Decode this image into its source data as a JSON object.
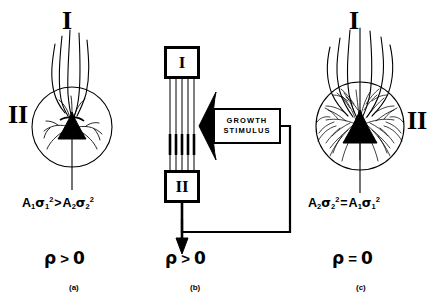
{
  "figure": {
    "caption_type": "three-panel neuronal growth diagram",
    "background_color": "#ffffff",
    "ink_color": "#000000"
  },
  "panels": [
    {
      "id": "a",
      "label": "(a)",
      "layer_top_label": "I",
      "layer_side_label": "II",
      "side_label_position": "left",
      "formula": {
        "lhs_amplitude": "A",
        "lhs_amplitude_sub": "1",
        "lhs_sigma_sub": "1",
        "lhs_sigma_sup": "2",
        "operator": ">",
        "rhs_amplitude": "A",
        "rhs_amplitude_sub": "2",
        "rhs_sigma_sub": "2",
        "rhs_sigma_sup": "2",
        "plain": "A1 σ1² > A2 σ2²"
      },
      "rho": {
        "symbol": "ρ",
        "relation": ">",
        "value": "0",
        "plain": "ρ > 0"
      },
      "neuron": {
        "arbor_density": "sparse",
        "soma_shape": "triangular",
        "field_shape": "circle"
      }
    },
    {
      "id": "b",
      "label": "(b)",
      "node_top": "I",
      "node_bottom": "II",
      "stimulus_line_1": "GROWTH",
      "stimulus_line_2": "STIMULUS",
      "connection_count": 5,
      "feedback": "output of II returns to growth stimulus",
      "rho": {
        "symbol": "ρ",
        "relation": ">",
        "value": "0",
        "plain": "ρ > 0"
      }
    },
    {
      "id": "c",
      "label": "(c)",
      "layer_top_label": "I",
      "layer_side_label": "II",
      "side_label_position": "right",
      "formula": {
        "lhs_amplitude": "A",
        "lhs_amplitude_sub": "2",
        "lhs_sigma_sub": "2",
        "lhs_sigma_sup": "2",
        "operator": "=",
        "rhs_amplitude": "A",
        "rhs_amplitude_sub": "1",
        "rhs_sigma_sub": "1",
        "rhs_sigma_sup": "2",
        "plain": "A2 σ2² = A1 σ1²"
      },
      "rho": {
        "symbol": "ρ",
        "relation": "=",
        "value": "0",
        "plain": "ρ = 0"
      },
      "neuron": {
        "arbor_density": "dense",
        "soma_shape": "triangular",
        "field_shape": "circle"
      }
    }
  ]
}
